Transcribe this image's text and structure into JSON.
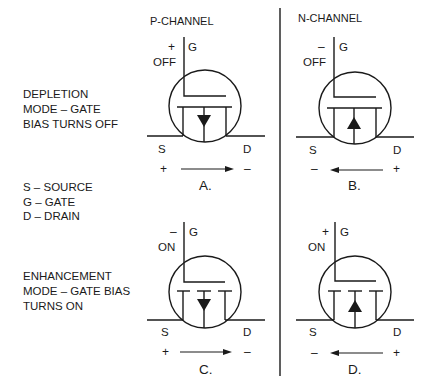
{
  "headers": {
    "p_channel": "P-CHANNEL",
    "n_channel": "N-CHANNEL"
  },
  "side_text": {
    "depletion": [
      "DEPLETION",
      "MODE – GATE",
      "BIAS TURNS OFF"
    ],
    "legend": [
      "S – SOURCE",
      "G – GATE",
      "D – DRAIN"
    ],
    "enhancement": [
      "ENHANCEMENT",
      "MODE – GATE BIAS",
      "TURNS ON"
    ]
  },
  "transistors": [
    {
      "id": "A",
      "caption": "A.",
      "channel": "P-CHANNEL",
      "mode": "depletion",
      "gate_label": "G",
      "gate_polarity": "+",
      "gate_state": "OFF",
      "source_label": "S",
      "drain_label": "D",
      "source_polarity": "+",
      "drain_polarity": "–",
      "current_direction": "right",
      "substrate_arrow": "down"
    },
    {
      "id": "B",
      "caption": "B.",
      "channel": "N-CHANNEL",
      "mode": "depletion",
      "gate_label": "G",
      "gate_polarity": "–",
      "gate_state": "OFF",
      "source_label": "S",
      "drain_label": "D",
      "source_polarity": "–",
      "drain_polarity": "+",
      "current_direction": "left",
      "substrate_arrow": "up"
    },
    {
      "id": "C",
      "caption": "C.",
      "channel": "P-CHANNEL",
      "mode": "enhancement",
      "gate_label": "G",
      "gate_polarity": "–",
      "gate_state": "ON",
      "source_label": "S",
      "drain_label": "D",
      "source_polarity": "+",
      "drain_polarity": "–",
      "current_direction": "right",
      "substrate_arrow": "down"
    },
    {
      "id": "D",
      "caption": "D.",
      "channel": "N-CHANNEL",
      "mode": "enhancement",
      "gate_label": "G",
      "gate_polarity": "+",
      "gate_state": "ON",
      "source_label": "S",
      "drain_label": "D",
      "source_polarity": "–",
      "drain_polarity": "+",
      "current_direction": "left",
      "substrate_arrow": "up"
    }
  ],
  "colors": {
    "ink": "#1a1a1a",
    "background": "#ffffff"
  }
}
